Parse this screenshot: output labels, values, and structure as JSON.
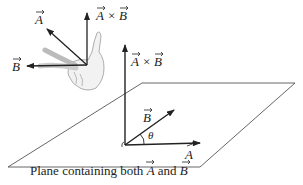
{
  "diagram": {
    "hand_figure": {
      "vector_a_label": "A",
      "vector_b_label": "B",
      "cross_label_a": "A",
      "cross_label_times": "×",
      "cross_label_b": "B"
    },
    "plane_figure": {
      "cross_label_a": "A",
      "cross_label_times": "×",
      "cross_label_b": "B",
      "vector_b_label": "B",
      "vector_a_label": "A",
      "angle_label": "θ",
      "caption_prefix": "Plane containing both ",
      "caption_a": "A",
      "caption_and": " and ",
      "caption_b": "B"
    },
    "colors": {
      "stroke": "#222222",
      "plane": "#555555",
      "hand_fill": "#f2f2f2",
      "hand_stroke": "#9a9a9a"
    }
  }
}
